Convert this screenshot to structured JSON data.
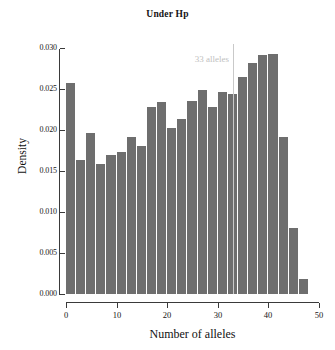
{
  "chart_data": {
    "type": "bar",
    "title": "Under Hp",
    "xlabel": "Number of alleles",
    "ylabel": "Density",
    "xlim": [
      0,
      50
    ],
    "ylim": [
      0.0,
      0.0305
    ],
    "xticks": [
      0,
      10,
      20,
      30,
      40,
      50
    ],
    "xtick_labels": [
      "0",
      "10",
      "20",
      "30",
      "40",
      "50"
    ],
    "yticks": [
      0.0,
      0.005,
      0.01,
      0.015,
      0.02,
      0.025,
      0.03
    ],
    "ytick_labels": [
      "0.000",
      "0.005",
      "0.010",
      "0.015",
      "0.020",
      "0.025",
      "0.030"
    ],
    "grid": false,
    "legend": null,
    "bin_width": 2,
    "bin_edges": [
      0,
      2,
      4,
      6,
      8,
      10,
      12,
      14,
      16,
      18,
      20,
      22,
      24,
      26,
      28,
      30,
      32,
      34,
      36,
      38,
      40,
      42,
      44,
      46,
      48
    ],
    "categories": [
      "0-2",
      "2-4",
      "4-6",
      "6-8",
      "8-10",
      "10-12",
      "12-14",
      "14-16",
      "16-18",
      "18-20",
      "20-22",
      "22-24",
      "24-26",
      "26-28",
      "28-30",
      "30-32",
      "32-34",
      "34-36",
      "36-38",
      "38-40",
      "40-42",
      "42-44",
      "44-46",
      "46-48"
    ],
    "values": [
      0.0257,
      0.0163,
      0.0196,
      0.0159,
      0.017,
      0.0173,
      0.0192,
      0.018,
      0.0228,
      0.0234,
      0.0203,
      0.0213,
      0.0236,
      0.0249,
      0.0228,
      0.0246,
      0.0244,
      0.0265,
      0.0282,
      0.0291,
      0.0293,
      0.0191,
      0.0081,
      0.0018
    ],
    "bar_color": "#6e6e6e",
    "annotations": [
      {
        "name": "observed-value-line",
        "label": "33 alleles",
        "x": 33,
        "color": "#c9c9c9",
        "label_color": "#c0c0c0",
        "y_top": 0.0305,
        "y_bottom": 0.0,
        "label_y": 0.0285
      }
    ]
  }
}
